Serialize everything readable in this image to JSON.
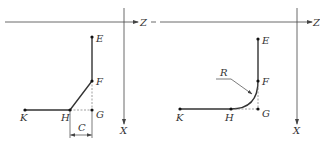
{
  "colors": {
    "background": "#ffffff",
    "line": "#333333",
    "axis": "#444444",
    "dashed": "#777777"
  },
  "diagrams": [
    {
      "id": "chamfer",
      "axes": {
        "horizontal_label": "Z",
        "vertical_label": "X"
      },
      "points": {
        "E": "E",
        "F": "F",
        "G": "G",
        "H": "H",
        "K": "K"
      },
      "dimension": {
        "label": "C"
      }
    },
    {
      "id": "fillet",
      "axes": {
        "horizontal_label": "Z",
        "vertical_label": "X"
      },
      "points": {
        "E": "E",
        "F": "F",
        "G": "G",
        "H": "H",
        "K": "K"
      },
      "radius": {
        "label": "R"
      }
    }
  ]
}
